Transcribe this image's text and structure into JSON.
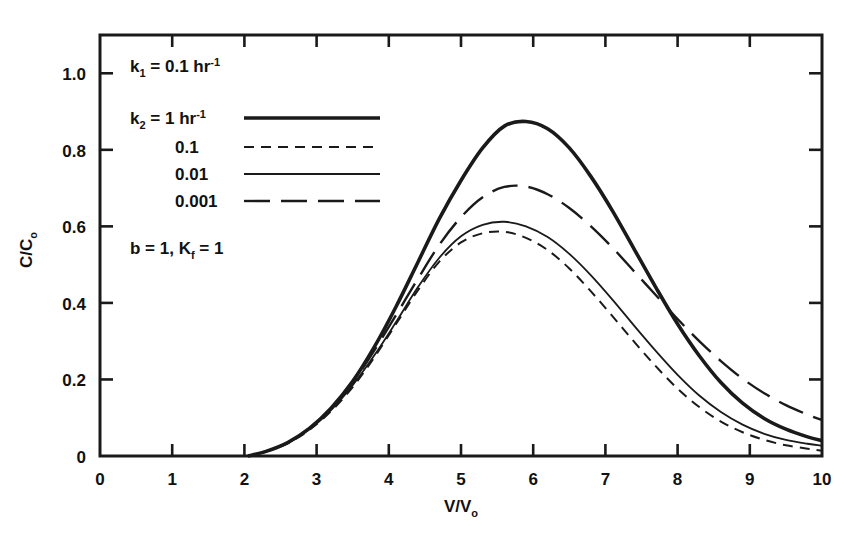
{
  "chart_data": {
    "type": "line",
    "title": "",
    "xlabel": "V/V₀",
    "ylabel": "C/C₀",
    "xlim": [
      0,
      10
    ],
    "ylim": [
      0,
      1.1
    ],
    "grid": false,
    "legend_position": "upper-left-inside",
    "x_ticks": [
      "0",
      "1",
      "2",
      "3",
      "4",
      "5",
      "6",
      "7",
      "8",
      "9",
      "10"
    ],
    "y_ticks": [
      "0",
      "0.2",
      "0.4",
      "0.6",
      "0.8",
      "1.0"
    ],
    "x_tick_values": [
      0,
      1,
      2,
      3,
      4,
      5,
      6,
      7,
      8,
      9,
      10
    ],
    "y_tick_values": [
      0,
      0.2,
      0.4,
      0.6,
      0.8,
      1.0
    ],
    "annotations": [
      {
        "id": "k1-note",
        "text": "k₁ = 0.1 hr⁻¹"
      },
      {
        "id": "k2-header",
        "text": "k₂ = 1 hr⁻¹"
      },
      {
        "id": "params-note",
        "text": "b = 1, Kᶠ = 1"
      }
    ],
    "legend_entries": [
      {
        "label": "1 hr⁻¹",
        "k2": 1,
        "style": "thick-solid",
        "linewidth": 3.6,
        "dash": "none"
      },
      {
        "label": "0.1",
        "k2": 0.1,
        "style": "short-dash",
        "linewidth": 2.0,
        "dash": "10,7"
      },
      {
        "label": "0.01",
        "k2": 0.01,
        "style": "thin-solid",
        "linewidth": 1.8,
        "dash": "none"
      },
      {
        "label": "0.001",
        "k2": 0.001,
        "style": "long-dash",
        "linewidth": 2.4,
        "dash": "26,11"
      }
    ],
    "series": [
      {
        "name": "k2 = 1 hr^-1",
        "style": "thick-solid",
        "peak_x": 5.6,
        "peak_y": 0.875,
        "x": [
          2.05,
          2.3,
          2.6,
          2.9,
          3.2,
          3.5,
          3.8,
          4.1,
          4.4,
          4.7,
          5.0,
          5.3,
          5.6,
          5.9,
          6.2,
          6.5,
          6.8,
          7.1,
          7.4,
          7.7,
          8.0,
          8.3,
          8.6,
          8.9,
          9.2,
          9.5,
          9.8,
          10.0
        ],
        "y": [
          0.0,
          0.012,
          0.035,
          0.072,
          0.125,
          0.195,
          0.285,
          0.39,
          0.505,
          0.62,
          0.72,
          0.805,
          0.862,
          0.874,
          0.855,
          0.805,
          0.73,
          0.64,
          0.54,
          0.44,
          0.345,
          0.262,
          0.192,
          0.138,
          0.098,
          0.07,
          0.05,
          0.04
        ]
      },
      {
        "name": "k2 = 0.1",
        "style": "short-dash",
        "peak_x": 5.45,
        "peak_y": 0.588,
        "x": [
          2.05,
          2.3,
          2.6,
          2.9,
          3.2,
          3.5,
          3.8,
          4.1,
          4.4,
          4.7,
          5.0,
          5.3,
          5.6,
          5.9,
          6.2,
          6.5,
          6.8,
          7.1,
          7.4,
          7.7,
          8.0,
          8.3,
          8.6,
          8.9,
          9.2,
          9.5,
          9.8,
          10.0
        ],
        "y": [
          0.0,
          0.012,
          0.033,
          0.068,
          0.117,
          0.18,
          0.258,
          0.345,
          0.432,
          0.508,
          0.558,
          0.582,
          0.586,
          0.57,
          0.538,
          0.49,
          0.43,
          0.365,
          0.298,
          0.234,
          0.176,
          0.128,
          0.09,
          0.062,
          0.042,
          0.028,
          0.019,
          0.014
        ]
      },
      {
        "name": "k2 = 0.01",
        "style": "thin-solid",
        "peak_x": 5.6,
        "peak_y": 0.612,
        "x": [
          2.05,
          2.3,
          2.6,
          2.9,
          3.2,
          3.5,
          3.8,
          4.1,
          4.4,
          4.7,
          5.0,
          5.3,
          5.6,
          5.9,
          6.2,
          6.5,
          6.8,
          7.1,
          7.4,
          7.7,
          8.0,
          8.3,
          8.6,
          8.9,
          9.2,
          9.5,
          9.8,
          10.0
        ],
        "y": [
          0.0,
          0.012,
          0.034,
          0.07,
          0.12,
          0.185,
          0.263,
          0.35,
          0.44,
          0.518,
          0.574,
          0.604,
          0.612,
          0.6,
          0.572,
          0.528,
          0.472,
          0.408,
          0.34,
          0.274,
          0.212,
          0.158,
          0.115,
          0.082,
          0.058,
          0.042,
          0.032,
          0.027
        ]
      },
      {
        "name": "k2 = 0.001",
        "style": "long-dash",
        "peak_x": 5.7,
        "peak_y": 0.705,
        "x": [
          2.05,
          2.3,
          2.6,
          2.9,
          3.2,
          3.5,
          3.8,
          4.1,
          4.4,
          4.7,
          5.0,
          5.3,
          5.6,
          5.9,
          6.2,
          6.5,
          6.8,
          7.1,
          7.4,
          7.7,
          8.0,
          8.3,
          8.6,
          8.9,
          9.2,
          9.5,
          9.8,
          10.0
        ],
        "y": [
          0.0,
          0.012,
          0.035,
          0.072,
          0.124,
          0.192,
          0.276,
          0.368,
          0.462,
          0.552,
          0.624,
          0.676,
          0.703,
          0.704,
          0.684,
          0.648,
          0.6,
          0.544,
          0.482,
          0.42,
          0.358,
          0.3,
          0.248,
          0.202,
          0.164,
          0.133,
          0.108,
          0.094
        ]
      }
    ]
  },
  "colors": {
    "line": "#1a1a1a",
    "axis": "#1a1a1a",
    "background": "#ffffff"
  }
}
